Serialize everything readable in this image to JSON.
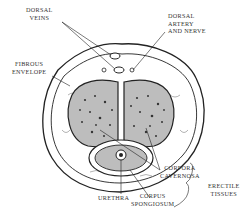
{
  "diagram": {
    "labels": {
      "dorsal_veins": "DORSAL\nVEINS",
      "dorsal_veins_l1": "DORSAL",
      "dorsal_veins_l2": "VEINS",
      "dorsal_artery_l1": "DORSAL",
      "dorsal_artery_l2": "ARTERY",
      "dorsal_artery_l3": "AND NERVE",
      "fibrous_l1": "FIBROUS",
      "fibrous_l2": "ENVELOPE",
      "corpora_l1": "CORPORA",
      "corpora_l2": "CAVERNOSA",
      "urethra": "URETHRA",
      "corpus_l1": "CORPUS",
      "corpus_l2": "SPONGIOSUM",
      "erectile_l1": "ERECTILE",
      "erectile_l2": "TISSUES"
    },
    "colors": {
      "line": "#222222",
      "tissue_fill": "#bdbdbd",
      "background": "#ffffff"
    }
  }
}
